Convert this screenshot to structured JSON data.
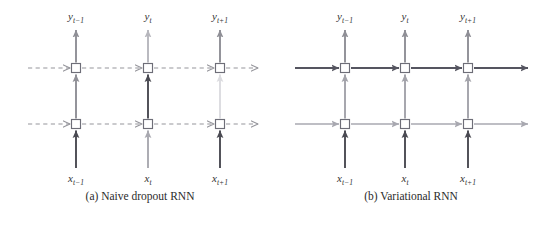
{
  "figure": {
    "panels": [
      {
        "id": "a",
        "caption": "(a) Naive dropout RNN",
        "recurrent_style": "dashed",
        "columns": [
          {
            "input_label": "x",
            "input_sub": "t−1",
            "output_label": "y",
            "output_sub": "t−1",
            "input_arrow_color": "#4a4a52",
            "mid_arrow_color": "#8f8f96",
            "out_arrow_color": "#8f8f96"
          },
          {
            "input_label": "x",
            "input_sub": "t",
            "output_label": "y",
            "output_sub": "t",
            "input_arrow_color": "#a9a9b0",
            "mid_arrow_color": "#4a4a52",
            "out_arrow_color": "#b7b7bd"
          },
          {
            "input_label": "x",
            "input_sub": "t+1",
            "output_label": "y",
            "output_sub": "t+1",
            "input_arrow_color": "#4a4a52",
            "mid_arrow_color": "#dcdce0",
            "out_arrow_color": "#8f8f96"
          }
        ],
        "recurrent_rows": [
          {
            "color": "#96969c"
          },
          {
            "color": "#96969c"
          }
        ]
      },
      {
        "id": "b",
        "caption": "(b) Variational RNN",
        "recurrent_style": "solid",
        "columns": [
          {
            "input_label": "x",
            "input_sub": "t−1",
            "output_label": "y",
            "output_sub": "t−1",
            "input_arrow_color": "#4a4a52",
            "mid_arrow_color": "#a3a3aa",
            "out_arrow_color": "#8f8f96"
          },
          {
            "input_label": "x",
            "input_sub": "t",
            "output_label": "y",
            "output_sub": "t",
            "input_arrow_color": "#4a4a52",
            "mid_arrow_color": "#a3a3aa",
            "out_arrow_color": "#8f8f96"
          },
          {
            "input_label": "x",
            "input_sub": "t+1",
            "output_label": "y",
            "output_sub": "t+1",
            "input_arrow_color": "#4a4a52",
            "mid_arrow_color": "#a3a3aa",
            "out_arrow_color": "#8f8f96"
          }
        ],
        "recurrent_rows": [
          {
            "color": "#555560"
          },
          {
            "color": "#a8a8b0"
          }
        ]
      }
    ],
    "node": {
      "fill": "#ffffff",
      "stroke": "#6e6e78",
      "size": 9
    }
  }
}
